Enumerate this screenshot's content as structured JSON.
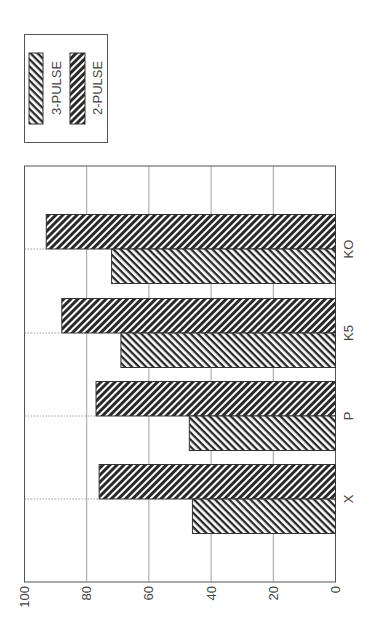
{
  "chart_data": {
    "type": "bar",
    "orientation": "rotated-90-ccw",
    "title": "",
    "xlabel": "",
    "ylabel": "",
    "categories": [
      "X",
      "P",
      "K5",
      "KO"
    ],
    "series": [
      {
        "name": "3-PULSE",
        "values": [
          46,
          47,
          69,
          72
        ],
        "pattern": "hatch-back",
        "color": "#333333"
      },
      {
        "name": "2-PULSE",
        "values": [
          76,
          77,
          88,
          93
        ],
        "pattern": "hatch-forward-dense",
        "color": "#222222"
      }
    ],
    "ylim": [
      0,
      100
    ],
    "yticks": [
      "0",
      "20",
      "40",
      "60",
      "80",
      "100"
    ],
    "grid": true,
    "legend_position": "top-left (rotated)"
  },
  "legend": {
    "items": [
      {
        "label": "3-PULSE"
      },
      {
        "label": "2-PULSE"
      }
    ]
  },
  "axis": {
    "ticks": [
      "0",
      "20",
      "40",
      "60",
      "80",
      "100"
    ]
  },
  "categories": [
    "X",
    "P",
    "K5",
    "KO"
  ]
}
